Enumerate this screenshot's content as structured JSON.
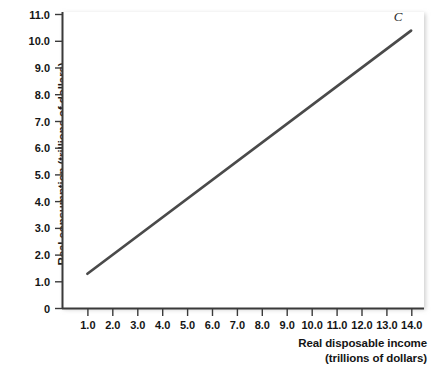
{
  "chart_data": {
    "type": "line",
    "title": "",
    "xlabel": "Real disposable income",
    "xlabel_unit": "(trillions of dollars)",
    "ylabel": "Real consumption (trillions of dollars)",
    "xlim": [
      0,
      14.6
    ],
    "ylim": [
      0,
      11.0
    ],
    "grid": false,
    "legend": "none",
    "xticks": [
      "1.0",
      "2.0",
      "3.0",
      "4.0",
      "5.0",
      "6.0",
      "7.0",
      "8.0",
      "9.0",
      "10.0",
      "11.0",
      "12.0",
      "13.0",
      "14.0"
    ],
    "xtick_values": [
      1,
      2,
      3,
      4,
      5,
      6,
      7,
      8,
      9,
      10,
      11,
      12,
      13,
      14
    ],
    "yticks": [
      "0",
      "1.0",
      "2.0",
      "3.0",
      "4.0",
      "5.0",
      "6.0",
      "7.0",
      "8.0",
      "9.0",
      "10.0",
      "11.0"
    ],
    "ytick_values": [
      0,
      1,
      2,
      3,
      4,
      5,
      6,
      7,
      8,
      9,
      10,
      11
    ],
    "series": [
      {
        "name": "C",
        "label": "C",
        "color": "#4a4a4a",
        "x": [
          1,
          2,
          3,
          4,
          5,
          6,
          7,
          8,
          9,
          10,
          11,
          12,
          13,
          14
        ],
        "values": [
          1.3,
          2.0,
          2.7,
          3.4,
          4.1,
          4.8,
          5.5,
          6.2,
          6.9,
          7.6,
          8.3,
          9.0,
          9.7,
          10.4
        ],
        "intercept": 0.6,
        "slope": 0.7,
        "x_start": 1.0,
        "y_start": 1.3,
        "x_end": 14.0,
        "y_end": 10.4
      }
    ],
    "annotations": [
      {
        "text": "C",
        "x": 13.3,
        "y": 10.75
      }
    ]
  },
  "axes": {
    "line_color": "#3a3a3a"
  }
}
